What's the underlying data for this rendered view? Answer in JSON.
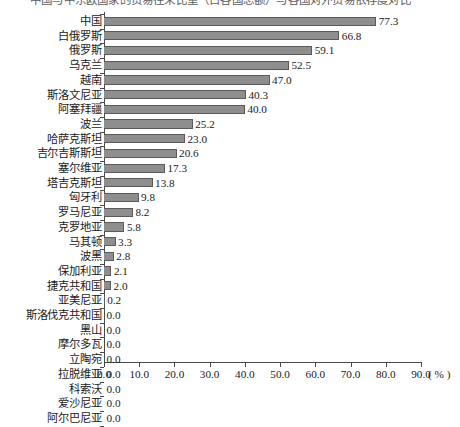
{
  "caption": {
    "text": "中国与中东欧国家的贸易往来比重（占各国总额）与各国对外贸易依存度对比"
  },
  "chart_data": {
    "type": "bar",
    "orientation": "horizontal",
    "title": "",
    "xlabel": "( % )",
    "ylabel": "",
    "xlim": [
      0.0,
      90.0
    ],
    "xticks": [
      "0.0",
      "10.0",
      "20.0",
      "30.0",
      "40.0",
      "50.0",
      "60.0",
      "70.0",
      "80.0",
      "90.0"
    ],
    "xtick_values": [
      0,
      10,
      20,
      30,
      40,
      50,
      60,
      70,
      80,
      90
    ],
    "grid": false,
    "legend": "none",
    "bar_color": "#8e8e8e",
    "bar_edge_color": "#5a5a5a",
    "axis_color": "#4a4a4a",
    "categories": [
      "中国",
      "白俄罗斯",
      "俄罗斯",
      "乌克兰",
      "越南",
      "斯洛文尼亚",
      "阿塞拜疆",
      "波兰",
      "哈萨克斯坦",
      "吉尔吉斯斯坦",
      "塞尔维亚",
      "塔吉克斯坦",
      "匈牙利",
      "罗马尼亚",
      "克罗地亚",
      "马其顿",
      "波黑",
      "保加利亚",
      "捷克共和国",
      "亚美尼亚",
      "斯洛伐克共和国",
      "黑山",
      "摩尔多瓦",
      "立陶宛",
      "拉脱维亚",
      "科索沃",
      "爱沙尼亚",
      "阿尔巴尼亚"
    ],
    "values": [
      77.3,
      66.8,
      59.1,
      52.5,
      47.0,
      40.3,
      40.0,
      25.2,
      23.0,
      20.6,
      17.3,
      13.8,
      9.8,
      8.2,
      5.8,
      3.3,
      2.8,
      2.1,
      2.0,
      0.2,
      0.0,
      0.0,
      0.0,
      0.0,
      0.0,
      0.0,
      0.0,
      0.0
    ],
    "value_labels": [
      "77.3",
      "66.8",
      "59.1",
      "52.5",
      "47.0",
      "40.3",
      "40.0",
      "25.2",
      "23.0",
      "20.6",
      "17.3",
      "13.8",
      "9.8",
      "8.2",
      "5.8",
      "3.3",
      "2.8",
      "2.1",
      "2.0",
      "0.2",
      "0.0",
      "0.0",
      "0.0",
      "0.0",
      "0.0",
      "0.0",
      "0.0",
      "0.0"
    ]
  }
}
